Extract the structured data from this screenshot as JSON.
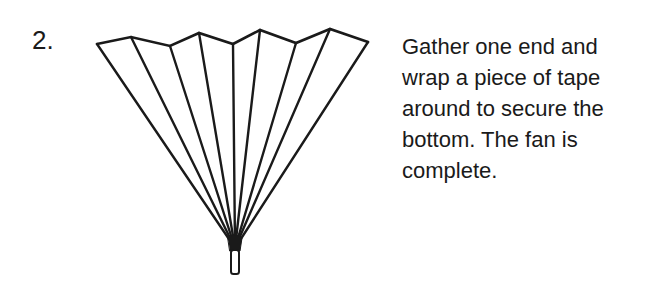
{
  "step": {
    "number": "2."
  },
  "instruction": {
    "lines": [
      "Gather one end and",
      "wrap a piece of tape",
      "around to secure the",
      "bottom. The fan is",
      "complete."
    ],
    "full_text": "Gather one end and wrap a piece of tape around to secure the bottom. The fan is complete."
  },
  "figure": {
    "stroke_color": "#1a1a1a",
    "top_vertices": [
      [
        97,
        44
      ],
      [
        131,
        37
      ],
      [
        170,
        46
      ],
      [
        199,
        33
      ],
      [
        233,
        44
      ],
      [
        260,
        30
      ],
      [
        296,
        43
      ],
      [
        330,
        29
      ],
      [
        368,
        42
      ]
    ],
    "gather_point": [
      235,
      248
    ],
    "tape": {
      "x": 231,
      "y": 250,
      "width": 8,
      "height": 24
    }
  }
}
